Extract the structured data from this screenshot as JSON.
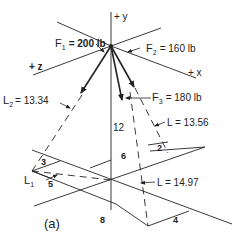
{
  "figure": {
    "caption": "(a)",
    "axes": {
      "y_label": "+ y",
      "x_label": "+ x",
      "z_label": "+ z"
    },
    "forces": [
      {
        "name": "F1",
        "sym": "F",
        "sub": "1",
        "value": "= 200 lb"
      },
      {
        "name": "F2",
        "sym": "F",
        "sub": "2",
        "value": "= 160 lb"
      },
      {
        "name": "F3",
        "sym": "F",
        "sub": "3",
        "value": "= 180 lb"
      }
    ],
    "lengths": [
      {
        "name": "L2",
        "sym": "L",
        "sub": "2",
        "value": "= 13.34"
      },
      {
        "name": "L",
        "text": "L = 13.56"
      },
      {
        "name": "L",
        "text": "L = 14.97"
      },
      {
        "name": "L1",
        "sym": "L",
        "sub": "1"
      }
    ],
    "dimensions": {
      "height": "12",
      "d3": "3",
      "d5": "5",
      "d6": "6",
      "d2": "2",
      "d8": "8",
      "d4": "4"
    },
    "colors": {
      "line": "#222222",
      "background": "#ffffff"
    }
  }
}
